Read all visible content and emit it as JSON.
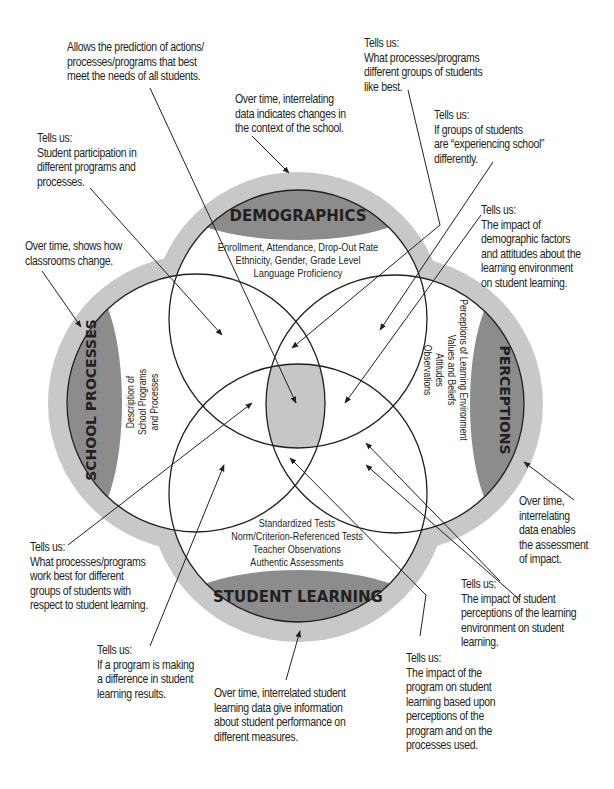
{
  "colors": {
    "ring": "#c8c8c8",
    "lens": "#8c8c8c",
    "center": "#c6c6c6",
    "line": "#231f20",
    "background": "#ffffff"
  },
  "circles": {
    "demographics": {
      "title": "DEMOGRAPHICS",
      "items": [
        "Enrollment, Attendance, Drop-Out Rate",
        "Ethnicity, Gender, Grade Level",
        "Language Proficiency"
      ]
    },
    "school_processes": {
      "title": "SCHOOL PROCESSES",
      "items": [
        "Description of",
        "School Programs",
        "and Processes"
      ]
    },
    "perceptions": {
      "title": "PERCEPTIONS",
      "items": [
        "Perceptions of Learning Environment",
        "Values and Beliefs",
        "Attitudes",
        "Observations"
      ]
    },
    "student_learning": {
      "title": "STUDENT LEARNING",
      "items": [
        "Standardized Tests",
        "Norm/Criterion-Referenced Tests",
        "Teacher Observations",
        "Authentic Assessments"
      ]
    }
  },
  "callouts": {
    "prediction": "Allows the prediction of actions/\nprocesses/programs that best\nmeet the needs of all students.",
    "demographics_over_time": "Over time, interrelating\ndata indicates changes in\nthe context of the school.",
    "participation": "Tells us:\nStudent participation in\ndifferent programs and\nprocesses.",
    "like_best": "Tells us:\nWhat processes/programs\ndifferent groups of students\nlike best.",
    "experiencing_school": "Tells us:\nIf groups of students\nare “experiencing school”\ndifferently.",
    "demographic_impact": "Tells us:\nThe impact of\ndemographic factors\nand attitudes about the\nlearning environment\non student learning.",
    "classrooms_change": "Over time, shows how\nclassrooms change.",
    "perceptions_over_time": "Over time,\ninterrelating\ndata enables\nthe assessment\nof impact.",
    "work_best": "Tells us:\nWhat processes/programs\nwork best for different\ngroups of students with\nrespect to student learning.",
    "perceptions_impact": "Tells us:\nThe impact of student\nperceptions of the learning\nenvironment on student\nlearning.",
    "making_difference": "Tells us:\nIf a program is making\na difference in student\nlearning results.",
    "learning_over_time": "Over time, interrelated student\nlearning data give information\nabout student performance on\ndifferent measures.",
    "program_impact": "Tells us:\nThe impact of the\nprogram on student\nlearning based upon\nperceptions of the\nprogram and on the\nprocesses used."
  }
}
